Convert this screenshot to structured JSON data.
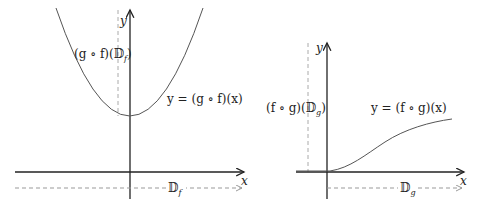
{
  "left_plot": {
    "x_axis_label": "x",
    "y_axis_label": "y",
    "curve_label": "y = (g ∘ f)(x)",
    "range_label": "(g ∘ f)(𝔻",
    "range_label_sub": "f",
    "range_label_end": ")",
    "domain_label": "𝔻",
    "domain_label_sub": "f"
  },
  "right_plot": {
    "x_axis_label": "x",
    "y_axis_label": "y",
    "curve_label": "y = (f ∘ g)(x)",
    "range_label": "(f ∘ g)(𝔻",
    "range_label_sub": "g",
    "range_label_end": ")",
    "domain_label": "𝔻",
    "domain_label_sub": "g"
  },
  "colors": {
    "axis": "#222222",
    "curve": "#555555",
    "dashed": "#999999"
  }
}
